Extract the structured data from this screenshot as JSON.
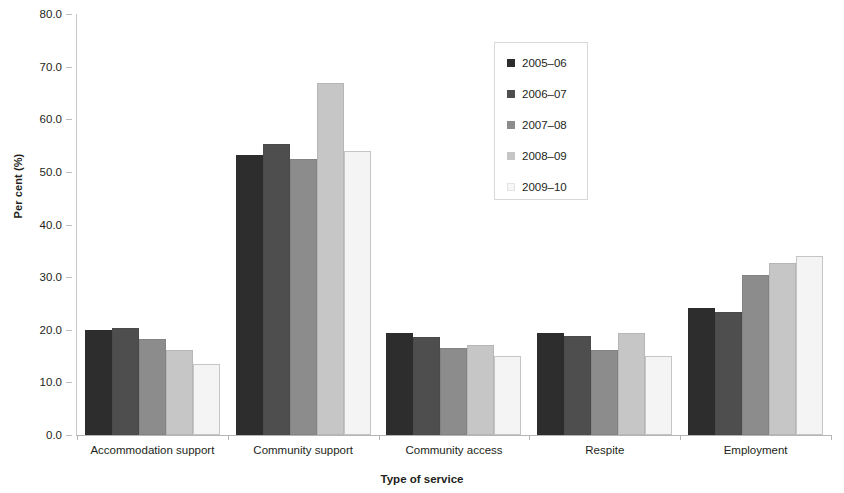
{
  "chart_data": {
    "type": "bar",
    "title": "",
    "xlabel": "Type of service",
    "ylabel": "Per cent (%)",
    "ylim": [
      0.0,
      80.0
    ],
    "y_ticks": [
      "0.0",
      "10.0",
      "20.0",
      "30.0",
      "40.0",
      "50.0",
      "60.0",
      "70.0",
      "80.0"
    ],
    "grid": false,
    "legend_position": "upper-center",
    "categories": [
      "Accommodation support",
      "Community support",
      "Community access",
      "Respite",
      "Employment"
    ],
    "series": [
      {
        "name": "2005–06",
        "color": "#2d2d2d",
        "values": [
          20.0,
          53.2,
          19.4,
          19.3,
          24.2
        ]
      },
      {
        "name": "2006–07",
        "color": "#4e4e4e",
        "values": [
          20.4,
          55.3,
          18.7,
          18.8,
          23.3
        ]
      },
      {
        "name": "2007–08",
        "color": "#8c8c8c",
        "values": [
          18.2,
          52.4,
          16.5,
          16.2,
          30.5
        ]
      },
      {
        "name": "2008–09",
        "color": "#c6c6c6",
        "values": [
          16.1,
          66.8,
          17.2,
          19.3,
          32.6
        ]
      },
      {
        "name": "2009–10",
        "color": "#f4f4f4",
        "values": [
          13.5,
          53.9,
          15.1,
          15.0,
          34.0
        ]
      }
    ]
  }
}
